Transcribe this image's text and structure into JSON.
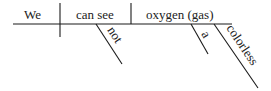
{
  "diagram": {
    "type": "sentence-diagram",
    "sentence": "We can not see colorless oxygen gas.",
    "subject": "We",
    "predicate": "can see",
    "object": "oxygen (gas)",
    "modifiers": {
      "predicate": [
        "not"
      ],
      "object": [
        "a",
        "colorless"
      ]
    },
    "colors": {
      "line": "#1a1a1a",
      "text": "#222222",
      "background": "#ffffff"
    }
  }
}
